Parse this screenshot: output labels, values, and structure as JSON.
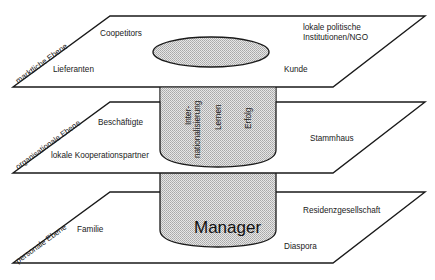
{
  "diagram": {
    "levels": [
      {
        "name": "markliche Ebene",
        "items": [
          "Coopetitors",
          "Lieferanten",
          "lokale politische",
          "Institutionen/NGO",
          "Kunde"
        ]
      },
      {
        "name": "organisationale Ebene",
        "items": [
          "Beschäftigte",
          "lokale Kooperationspartner",
          "Stammhaus"
        ]
      },
      {
        "name": "personale Ebene",
        "items": [
          "Familie",
          "Residenzgesellschaft",
          "Diaspora"
        ]
      }
    ],
    "top": {
      "level_label": "marktliche Ebene",
      "coopetitors": "Coopetitors",
      "lieferanten": "Lieferanten",
      "institutions_line1": "lokale politische",
      "institutions_line2": "Institutionen/NGO",
      "kunde": "Kunde"
    },
    "middle": {
      "level_label": "organisationale Ebene",
      "beschaeftigte": "Beschäftigte",
      "kooperation": "lokale Kooperationspartner",
      "stammhaus": "Stammhaus",
      "cylinder_labels": {
        "intern_line1": "Inter-",
        "intern_line2": "nationalisierung",
        "lernen": "Lernen",
        "erfolg": "Erfolg"
      }
    },
    "bottom": {
      "level_label": "personale Ebene",
      "familie": "Familie",
      "residenz": "Residenzgesellschaft",
      "diaspora": "Diaspora",
      "core": "Manager"
    },
    "colors": {
      "line": "#1a1a1a",
      "fill_pattern": "#c8c8c8",
      "background": "#ffffff"
    }
  }
}
